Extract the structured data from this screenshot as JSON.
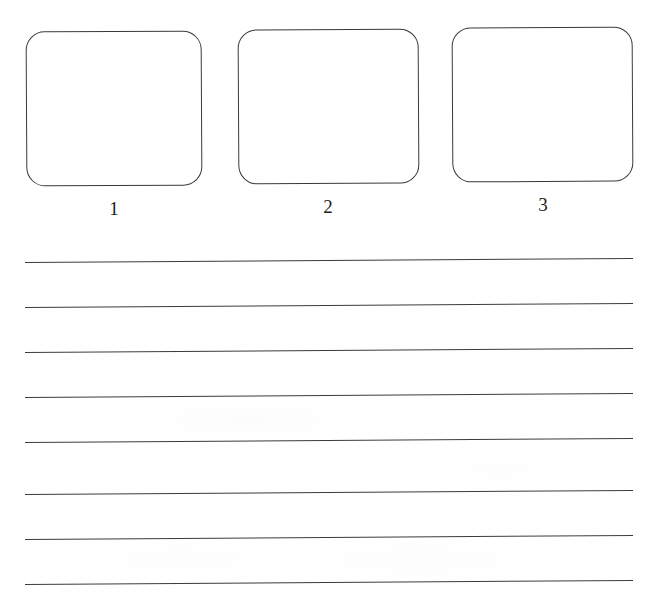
{
  "document": {
    "type": "worksheet",
    "page_width": 657,
    "page_height": 593,
    "background_color": "#ffffff",
    "ink_color": "#3a3a3e",
    "description": "Scanned blank worksheet: three empty rounded drawing boxes numbered 1-3 above eight ruled writing lines"
  },
  "boxes": {
    "count": 3,
    "items": [
      {
        "caption": "1",
        "x": 26,
        "y": 31,
        "width": 176,
        "height": 155,
        "corner_radius": 19,
        "content": ""
      },
      {
        "caption": "2",
        "x": 238,
        "y": 29,
        "width": 181,
        "height": 155,
        "corner_radius": 19,
        "content": ""
      },
      {
        "caption": "3",
        "x": 452,
        "y": 27,
        "width": 181,
        "height": 155,
        "corner_radius": 19,
        "content": ""
      }
    ]
  },
  "ruled_lines": {
    "count": 8,
    "left_x": 25,
    "right_x": 633,
    "spacing": 45,
    "skew_degrees": -0.38,
    "y_positions": [
      262,
      307,
      352,
      397,
      442,
      494,
      539,
      584
    ]
  }
}
